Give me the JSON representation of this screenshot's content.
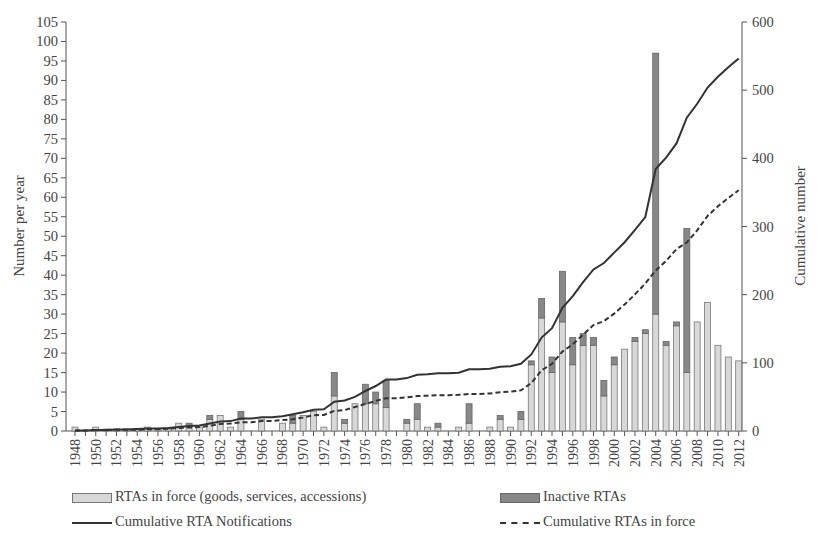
{
  "chart_data": {
    "type": "bar",
    "title": "",
    "xlabel": "",
    "ylabel": "Number per year",
    "y2label": "Cumulative number",
    "ylim": [
      0,
      105
    ],
    "y2lim": [
      0,
      600
    ],
    "yticks": [
      0,
      5,
      10,
      15,
      20,
      25,
      30,
      35,
      40,
      45,
      50,
      55,
      60,
      65,
      70,
      75,
      80,
      85,
      90,
      95,
      100,
      105
    ],
    "y2ticks": [
      0,
      100,
      200,
      300,
      400,
      500,
      600
    ],
    "x": [
      1948,
      1949,
      1950,
      1951,
      1952,
      1953,
      1954,
      1955,
      1956,
      1957,
      1958,
      1959,
      1960,
      1961,
      1962,
      1963,
      1964,
      1965,
      1966,
      1967,
      1968,
      1969,
      1970,
      1971,
      1972,
      1973,
      1974,
      1975,
      1976,
      1977,
      1978,
      1979,
      1980,
      1981,
      1982,
      1983,
      1984,
      1985,
      1986,
      1987,
      1988,
      1989,
      1990,
      1991,
      1992,
      1993,
      1994,
      1995,
      1996,
      1997,
      1998,
      1999,
      2000,
      2001,
      2002,
      2003,
      2004,
      2005,
      2006,
      2007,
      2008,
      2009,
      2010,
      2011,
      2012
    ],
    "xtick_labels": [
      "1948",
      "1950",
      "1952",
      "1954",
      "1956",
      "1958",
      "1960",
      "1962",
      "1964",
      "1966",
      "1968",
      "1970",
      "1972",
      "1974",
      "1976",
      "1978",
      "1980",
      "1982",
      "1984",
      "1986",
      "1988",
      "1990",
      "1992",
      "1994",
      "1996",
      "1998",
      "2000",
      "2002",
      "2004",
      "2006",
      "2008",
      "2010",
      "2012"
    ],
    "series": [
      {
        "name": "RTAs in force (goods, services, accessions)",
        "kind": "bar",
        "axis": "left",
        "values": [
          1,
          0,
          1,
          0.5,
          0.5,
          0.5,
          0.5,
          1,
          0.5,
          0.5,
          2,
          1,
          1,
          3,
          4,
          1,
          3,
          0,
          3,
          0,
          2,
          2,
          4,
          5,
          1,
          9,
          2,
          7,
          7,
          7,
          6,
          0,
          2,
          3,
          1,
          1,
          0,
          1,
          2,
          0,
          1,
          3,
          1,
          3,
          17,
          29,
          15,
          28,
          17,
          22,
          22,
          9,
          17,
          21,
          23,
          25,
          30,
          22,
          27,
          15,
          28,
          33,
          22,
          19,
          18
        ]
      },
      {
        "name": "Inactive RTAs",
        "kind": "bar",
        "axis": "left",
        "values": [
          0,
          0,
          0,
          0,
          0,
          0,
          0,
          0,
          0,
          0,
          0,
          1,
          0,
          1,
          0,
          0,
          2,
          0,
          0,
          0,
          0,
          2,
          0,
          0,
          0,
          6,
          1,
          0,
          5,
          3,
          7,
          0,
          1,
          4,
          0,
          1,
          0,
          0,
          5,
          0,
          0,
          1,
          0,
          2,
          1,
          5,
          4,
          13,
          7,
          3,
          2,
          4,
          2,
          0,
          1,
          1,
          67,
          1,
          1,
          37,
          0,
          0,
          0,
          0,
          0
        ]
      },
      {
        "name": "Cumulative RTA Notifications",
        "kind": "line",
        "axis": "right",
        "values": [
          1,
          1,
          2,
          2,
          3,
          3,
          4,
          5,
          5,
          6,
          8,
          10,
          11,
          15,
          19,
          20,
          25,
          25,
          28,
          28,
          30,
          34,
          38,
          43,
          44,
          59,
          62,
          69,
          81,
          91,
          104,
          104,
          107,
          114,
          115,
          117,
          117,
          118,
          125,
          125,
          126,
          130,
          131,
          136,
          155,
          189,
          208,
          249,
          273,
          301,
          327,
          340,
          361,
          382,
          407,
          433,
          530,
          553,
          582,
          634,
          662,
          695,
          717,
          736,
          754
        ]
      },
      {
        "name": "Cumulative RTAs in force",
        "kind": "line",
        "axis": "right",
        "values": [
          1,
          1,
          2,
          2,
          3,
          3,
          3,
          4,
          4,
          5,
          7,
          8,
          9,
          12,
          16,
          17,
          20,
          20,
          23,
          23,
          25,
          27,
          31,
          36,
          37,
          46,
          48,
          55,
          62,
          69,
          75,
          75,
          77,
          80,
          81,
          82,
          82,
          83,
          85,
          85,
          86,
          89,
          90,
          93,
          110,
          139,
          154,
          182,
          199,
          221,
          243,
          252,
          269,
          290,
          313,
          338,
          368,
          390,
          417,
          432,
          460,
          493,
          515,
          534,
          552
        ]
      }
    ],
    "legend": {
      "position": "bottom",
      "columns": 2
    },
    "grid": false
  },
  "legend": {
    "in_force": "RTAs in force (goods, services, accessions)",
    "inactive": "Inactive RTAs",
    "cum_notifications": "Cumulative RTA Notifications",
    "cum_in_force": "Cumulative RTAs in force"
  },
  "axes": {
    "left_label": "Number per year",
    "right_label": "Cumulative number"
  },
  "colors": {
    "in_force_fill": "#d8d8d8",
    "inactive_fill": "#888888",
    "bar_border": "#777777",
    "line": "#333333",
    "axis": "#555555",
    "text": "#444444"
  }
}
